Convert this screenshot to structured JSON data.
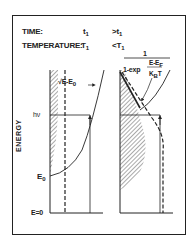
{
  "header": {
    "time_label": "TIME:",
    "temperature_label": "TEMPERATURE:",
    "left_time": "t",
    "left_time_sub": "1",
    "left_temp": "T",
    "left_temp_sub": "1",
    "right_time": ">t",
    "right_time_sub": "1",
    "right_temp": "<T",
    "right_temp_sub": "1"
  },
  "left_panel": {
    "formula": "√E-E",
    "formula_sub": "0",
    "photon_label": "hν",
    "e0_label": "E",
    "e0_sub": "0",
    "zero_label": "E=0"
  },
  "right_panel": {
    "formula_numerator": "1",
    "formula_denominator_prefix": "1-exp",
    "formula_inner_numerator": "E-E",
    "formula_inner_numerator_sub": "F",
    "formula_inner_denominator": "K",
    "formula_inner_denominator_sub": "B",
    "formula_inner_denominator_suffix": "T"
  },
  "axis": {
    "ylabel": "ENERGY"
  },
  "colors": {
    "ink": "#222222",
    "background": "#ffffff"
  }
}
